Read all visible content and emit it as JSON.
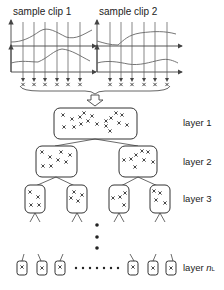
{
  "diagram": {
    "clips": [
      {
        "title": "sample clip 1"
      },
      {
        "title": "sample clip 2"
      }
    ],
    "layers": [
      {
        "label": "layer 1",
        "nodes": 1
      },
      {
        "label": "layer 2",
        "nodes": 2
      },
      {
        "label": "layer 3",
        "nodes": 4
      },
      {
        "label_prefix": "layer ",
        "label_var": "n",
        "label_sub": "L",
        "nodes": 6
      }
    ],
    "ellipsis_dots": "• • • • • • •",
    "vertical_ellipsis": "⋮",
    "colors": {
      "line": "#444444",
      "curve": "#666666",
      "node_border": "#333333",
      "background": "#ffffff"
    }
  }
}
